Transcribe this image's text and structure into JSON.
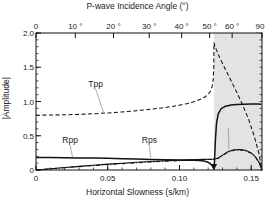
{
  "chart_data": {
    "type": "line",
    "title": "",
    "xlabel": "Horizontal Slowness (s/km)",
    "ylabel": "|Amplitude|",
    "top_xlabel": "P-wave Incidence Angle (°)",
    "xlim": [
      0,
      0.1575
    ],
    "ylim": [
      0,
      2.0
    ],
    "xticks": [
      0,
      0.05,
      0.1,
      0.15
    ],
    "xticklabels": [
      "0",
      "0.05",
      "0.10",
      "0.15"
    ],
    "yticks": [
      0,
      0.5,
      1.0,
      1.5,
      2.0
    ],
    "yticklabels": [
      "0",
      "0.5",
      "1.0",
      "1.5",
      "2.0"
    ],
    "top_ticks_slowness": [
      0,
      0.0274,
      0.054,
      0.0789,
      0.1015,
      0.121,
      0.1367,
      0.1575
    ],
    "top_ticklabels": [
      "0",
      "10 °",
      "20 °",
      "30 °",
      "40 °",
      "50 °",
      "60 °",
      "90 °"
    ],
    "grid": false,
    "legend": "inline-annotations",
    "critical_slowness": 0.124,
    "shaded_region": {
      "from": 0.124,
      "to": 0.1575,
      "color": "#e3e3e3",
      "note": "post-critical"
    },
    "annotations": [
      {
        "label": "Tpp",
        "x": 0.0415,
        "y": 1.255,
        "leader_to": {
          "x": 0.047,
          "y": 0.845
        }
      },
      {
        "label": "Rpp",
        "x": 0.0238,
        "y": 0.435,
        "leader_to": {
          "x": 0.0255,
          "y": 0.185
        }
      },
      {
        "label": "Rps",
        "x": 0.079,
        "y": 0.435,
        "leader_to": {
          "x": 0.08,
          "y": 0.17
        }
      },
      {
        "label": "Tps",
        "x": 0.134,
        "y": 0.685,
        "leader_to": {
          "x": 0.1345,
          "y": 0.3
        }
      }
    ],
    "series": [
      {
        "name": "Tpp",
        "style": "dashed",
        "color": "#111111",
        "points": [
          [
            0.0,
            0.8
          ],
          [
            0.01,
            0.802
          ],
          [
            0.02,
            0.806
          ],
          [
            0.03,
            0.812
          ],
          [
            0.04,
            0.821
          ],
          [
            0.05,
            0.833
          ],
          [
            0.06,
            0.848
          ],
          [
            0.07,
            0.866
          ],
          [
            0.08,
            0.887
          ],
          [
            0.09,
            0.912
          ],
          [
            0.095,
            0.928
          ],
          [
            0.1,
            0.946
          ],
          [
            0.105,
            0.968
          ],
          [
            0.11,
            0.996
          ],
          [
            0.115,
            1.036
          ],
          [
            0.118,
            1.07
          ],
          [
            0.12,
            1.105
          ],
          [
            0.1215,
            1.15
          ],
          [
            0.1228,
            1.22
          ],
          [
            0.1235,
            1.32
          ],
          [
            0.1239,
            1.5
          ],
          [
            0.124,
            1.86
          ],
          [
            0.125,
            1.79
          ],
          [
            0.128,
            1.64
          ],
          [
            0.132,
            1.47
          ],
          [
            0.136,
            1.3
          ],
          [
            0.14,
            1.13
          ],
          [
            0.144,
            0.95
          ],
          [
            0.148,
            0.75
          ],
          [
            0.152,
            0.5
          ],
          [
            0.1555,
            0.23
          ],
          [
            0.1575,
            0.0
          ]
        ]
      },
      {
        "name": "Rpp",
        "style": "solid",
        "color": "#111111",
        "points": [
          [
            0.0,
            0.182
          ],
          [
            0.01,
            0.181
          ],
          [
            0.02,
            0.179
          ],
          [
            0.03,
            0.177
          ],
          [
            0.04,
            0.174
          ],
          [
            0.05,
            0.17
          ],
          [
            0.06,
            0.165
          ],
          [
            0.07,
            0.16
          ],
          [
            0.08,
            0.155
          ],
          [
            0.09,
            0.15
          ],
          [
            0.1,
            0.146
          ],
          [
            0.106,
            0.144
          ],
          [
            0.11,
            0.142
          ],
          [
            0.114,
            0.138
          ],
          [
            0.117,
            0.13
          ],
          [
            0.1195,
            0.116
          ],
          [
            0.1215,
            0.092
          ],
          [
            0.1228,
            0.062
          ],
          [
            0.1236,
            0.032
          ],
          [
            0.124,
            0.008
          ],
          [
            0.1244,
            0.12
          ],
          [
            0.125,
            0.43
          ],
          [
            0.1258,
            0.68
          ],
          [
            0.127,
            0.82
          ],
          [
            0.129,
            0.895
          ],
          [
            0.132,
            0.93
          ],
          [
            0.136,
            0.948
          ],
          [
            0.14,
            0.955
          ],
          [
            0.145,
            0.96
          ],
          [
            0.15,
            0.962
          ],
          [
            0.1545,
            0.962
          ],
          [
            0.157,
            0.96
          ]
        ]
      },
      {
        "name": "Rps",
        "style": "solid-thin",
        "color": "#111111",
        "points": [
          [
            0.0,
            0.0
          ],
          [
            0.01,
            0.018
          ],
          [
            0.02,
            0.036
          ],
          [
            0.03,
            0.053
          ],
          [
            0.04,
            0.07
          ],
          [
            0.05,
            0.086
          ],
          [
            0.06,
            0.1
          ],
          [
            0.07,
            0.113
          ],
          [
            0.08,
            0.124
          ],
          [
            0.09,
            0.134
          ],
          [
            0.1,
            0.143
          ],
          [
            0.106,
            0.148
          ],
          [
            0.112,
            0.152
          ],
          [
            0.117,
            0.155
          ],
          [
            0.121,
            0.157
          ],
          [
            0.124,
            0.158
          ],
          [
            0.127,
            0.175
          ],
          [
            0.13,
            0.218
          ],
          [
            0.134,
            0.27
          ],
          [
            0.138,
            0.295
          ],
          [
            0.142,
            0.3
          ],
          [
            0.146,
            0.288
          ],
          [
            0.15,
            0.25
          ],
          [
            0.153,
            0.19
          ],
          [
            0.1555,
            0.11
          ],
          [
            0.1575,
            0.0
          ]
        ]
      },
      {
        "name": "Tps",
        "style": "dash-dot",
        "color": "#111111",
        "points": [
          [
            0.0,
            0.0
          ],
          [
            0.01,
            0.016
          ],
          [
            0.02,
            0.033
          ],
          [
            0.03,
            0.049
          ],
          [
            0.04,
            0.064
          ],
          [
            0.05,
            0.079
          ],
          [
            0.06,
            0.093
          ],
          [
            0.07,
            0.105
          ],
          [
            0.08,
            0.116
          ],
          [
            0.09,
            0.127
          ],
          [
            0.1,
            0.136
          ],
          [
            0.106,
            0.142
          ],
          [
            0.112,
            0.147
          ],
          [
            0.117,
            0.151
          ],
          [
            0.121,
            0.154
          ],
          [
            0.124,
            0.156
          ],
          [
            0.127,
            0.17
          ],
          [
            0.13,
            0.212
          ],
          [
            0.134,
            0.262
          ],
          [
            0.138,
            0.288
          ],
          [
            0.142,
            0.292
          ],
          [
            0.146,
            0.28
          ],
          [
            0.15,
            0.243
          ],
          [
            0.153,
            0.185
          ],
          [
            0.1555,
            0.105
          ],
          [
            0.1575,
            0.0
          ]
        ]
      }
    ]
  },
  "axes": {
    "top_title": "P-wave Incidence Angle (°)",
    "bottom_title": "Horizontal Slowness (s/km)",
    "left_title": "|Amplitude|"
  }
}
